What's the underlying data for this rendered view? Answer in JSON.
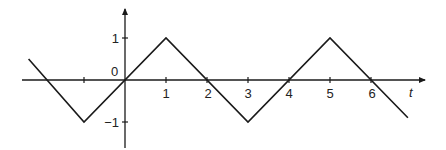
{
  "chart_data": {
    "type": "line",
    "title": "",
    "xlabel": "t",
    "ylabel": "",
    "origin_label": "0",
    "x_ticks": [
      -1,
      1,
      2,
      3,
      4,
      5,
      6
    ],
    "x_tick_labels": [
      "",
      "1",
      "2",
      "3",
      "4",
      "5",
      "6"
    ],
    "y_ticks": [
      1,
      -1
    ],
    "y_tick_labels": [
      "1",
      "−1"
    ],
    "xlim": [
      -2.5,
      7.3
    ],
    "ylim": [
      -1.6,
      1.8
    ],
    "grid": false,
    "legend": null,
    "series": [
      {
        "name": "triangle wave",
        "x": [
          -2.35,
          -1,
          1,
          3,
          5,
          6.9
        ],
        "y": [
          0.5,
          -1,
          1,
          -1,
          1,
          -0.9
        ]
      }
    ],
    "color": "#1a1a1a"
  }
}
